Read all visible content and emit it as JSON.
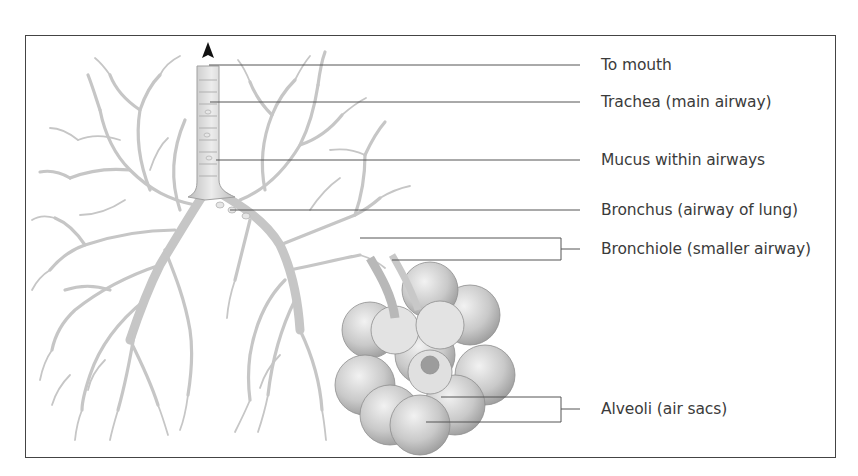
{
  "diagram": {
    "labels": [
      {
        "id": "to-mouth",
        "text": "To mouth",
        "y": 65
      },
      {
        "id": "trachea",
        "text": "Trachea (main airway)",
        "y": 102
      },
      {
        "id": "mucus",
        "text": "Mucus within airways",
        "y": 160
      },
      {
        "id": "bronchus",
        "text": "Bronchus (airway of lung)",
        "y": 210
      },
      {
        "id": "bronchiole",
        "text": "Bronchiole (smaller airway)",
        "y": 249
      },
      {
        "id": "alveoli",
        "text": "Alveoli (air sacs)",
        "y": 409
      }
    ],
    "colors": {
      "frame": "#444444",
      "leader_line": "#555555",
      "airway_fill": "#d8d8d8",
      "airway_stroke": "#a8a8a8",
      "alveoli_fill": "#c4c4c4",
      "text": "#3b3b3b"
    }
  }
}
